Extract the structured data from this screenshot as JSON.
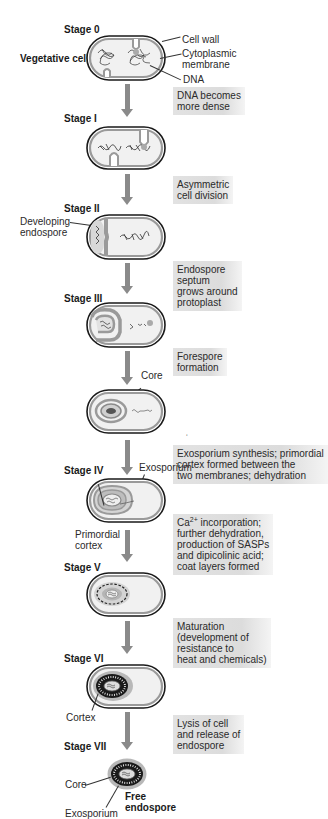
{
  "figure": {
    "title_fragment": "",
    "stages": [
      {
        "id": "stage-0",
        "label": "Stage 0",
        "side_label": "Vegetative cell"
      },
      {
        "id": "stage-1",
        "label": "Stage I"
      },
      {
        "id": "stage-2",
        "label": "Stage II"
      },
      {
        "id": "stage-3",
        "label": "Stage III"
      },
      {
        "id": "stage-4",
        "label": "Stage IV"
      },
      {
        "id": "stage-5",
        "label": "Stage V"
      },
      {
        "id": "stage-6",
        "label": "Stage VI"
      },
      {
        "id": "stage-7",
        "label": "Stage VII"
      }
    ],
    "annotations": {
      "cell_wall": "Cell wall",
      "cytoplasmic_membrane_1": "Cytoplasmic",
      "cytoplasmic_membrane_2": "membrane",
      "dna": "DNA",
      "developing_endospore_1": "Developing",
      "developing_endospore_2": "endospore",
      "core_forespore": "Core",
      "exosporium_stage4": "Exosporium",
      "primordial_cortex_1": "Primordial",
      "primordial_cortex_2": "cortex",
      "cortex": "Cortex",
      "core_free": "Core",
      "exosporium_free": "Exosporium",
      "free_endospore_1": "Free",
      "free_endospore_2": "endospore"
    },
    "process_steps": [
      {
        "lines": [
          "DNA becomes",
          "more dense"
        ]
      },
      {
        "lines": [
          "Asymmetric",
          "cell division"
        ]
      },
      {
        "lines": [
          "Endospore",
          "septum",
          "grows around",
          "protoplast"
        ]
      },
      {
        "lines": [
          "Forespore",
          "formation"
        ]
      },
      {
        "lines": [
          "Exosporium synthesis; primordial",
          "cortex formed between the",
          "two membranes; dehydration"
        ]
      },
      {
        "ca_prefix": "Ca",
        "ca_sup": "2+",
        "ca_suffix": " incorporation;",
        "lines": [
          "further dehydration,",
          "production of SASPs",
          "and dipicolinic acid;",
          "coat layers formed"
        ]
      },
      {
        "lines": [
          "Maturation",
          "(development of",
          "resistance to",
          "heat and chemicals)"
        ]
      },
      {
        "lines": [
          "Lysis of cell",
          "and release of",
          "endospore"
        ]
      }
    ],
    "colors": {
      "arrow": "#8a8a8a",
      "cell_wall": "#1a1a1a",
      "membrane": "#9a9a9a",
      "cytoplasm": "#f1f1f1",
      "process_box": "#dddddd"
    }
  }
}
